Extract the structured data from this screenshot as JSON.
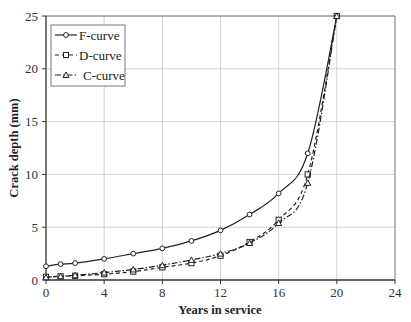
{
  "chart_data": {
    "type": "line",
    "title": "",
    "xlabel": "Years in service",
    "ylabel": "Crack depth (mm)",
    "xlim": [
      0,
      24
    ],
    "ylim": [
      0,
      25
    ],
    "xticks": [
      0,
      4,
      8,
      12,
      16,
      20,
      24
    ],
    "yticks": [
      0,
      5,
      10,
      15,
      20,
      25
    ],
    "grid": true,
    "legend_position": "upper-left",
    "x": [
      0,
      1,
      2,
      4,
      6,
      8,
      10,
      12,
      14,
      16,
      18,
      20
    ],
    "series": [
      {
        "name": "F-curve",
        "marker": "circle",
        "line_style": "solid",
        "values": [
          1.3,
          1.5,
          1.6,
          2.0,
          2.5,
          3.0,
          3.7,
          4.7,
          6.2,
          8.2,
          12.0,
          25.0
        ]
      },
      {
        "name": "D-curve",
        "marker": "square",
        "line_style": "dashed",
        "values": [
          0.3,
          0.35,
          0.4,
          0.55,
          0.8,
          1.2,
          1.6,
          2.3,
          3.6,
          5.7,
          10.0,
          25.0
        ]
      },
      {
        "name": "C-curve",
        "marker": "triangle",
        "line_style": "dash-dot",
        "values": [
          0.25,
          0.35,
          0.45,
          0.7,
          1.0,
          1.4,
          1.9,
          2.5,
          3.5,
          5.4,
          9.2,
          25.0
        ]
      }
    ]
  },
  "labels": {
    "xlabel": "Years in service",
    "ylabel": "Crack depth (mm)",
    "legend": [
      "F-curve",
      "D-curve",
      "C-curve"
    ]
  },
  "colors": {
    "line": "#222222",
    "grid": "#c8c8c8",
    "frame": "#333333",
    "background": "#ffffff"
  }
}
